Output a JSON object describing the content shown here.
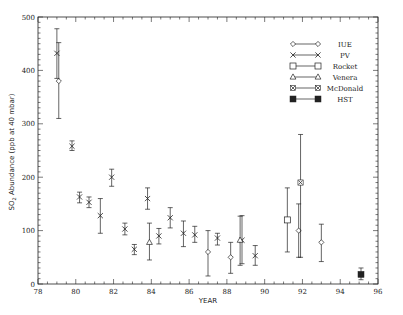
{
  "chart_data": {
    "type": "scatter",
    "title": "",
    "xlabel": "YEAR",
    "ylabel": "SO2 Abundance (ppb at 40 mbar)",
    "xlim": [
      78,
      96
    ],
    "ylim": [
      0,
      500
    ],
    "xticks": [
      78,
      80,
      82,
      84,
      86,
      88,
      90,
      92,
      94,
      96
    ],
    "yticks": [
      0,
      100,
      200,
      300,
      400,
      500
    ],
    "grid": false,
    "legend_position": "upper right",
    "series": [
      {
        "name": "IUE",
        "marker": "diamond-open",
        "points": [
          {
            "x": 79.1,
            "y": 380,
            "lo": 310,
            "hi": 452
          },
          {
            "x": 87.0,
            "y": 60,
            "lo": 15,
            "hi": 100
          },
          {
            "x": 88.2,
            "y": 50,
            "lo": 20,
            "hi": 78
          },
          {
            "x": 91.8,
            "y": 100,
            "lo": 50,
            "hi": 150
          },
          {
            "x": 93.0,
            "y": 78,
            "lo": 42,
            "hi": 112
          }
        ]
      },
      {
        "name": "PV",
        "marker": "x",
        "points": [
          {
            "x": 79.0,
            "y": 432,
            "lo": 385,
            "hi": 478
          },
          {
            "x": 79.8,
            "y": 258,
            "lo": 250,
            "hi": 268
          },
          {
            "x": 80.2,
            "y": 163,
            "lo": 152,
            "hi": 172
          },
          {
            "x": 80.7,
            "y": 153,
            "lo": 143,
            "hi": 163
          },
          {
            "x": 81.3,
            "y": 128,
            "lo": 95,
            "hi": 160
          },
          {
            "x": 81.9,
            "y": 200,
            "lo": 183,
            "hi": 215
          },
          {
            "x": 82.6,
            "y": 103,
            "lo": 92,
            "hi": 114
          },
          {
            "x": 83.1,
            "y": 65,
            "lo": 55,
            "hi": 74
          },
          {
            "x": 83.8,
            "y": 160,
            "lo": 140,
            "hi": 180
          },
          {
            "x": 84.4,
            "y": 90,
            "lo": 75,
            "hi": 104
          },
          {
            "x": 85.0,
            "y": 124,
            "lo": 105,
            "hi": 143
          },
          {
            "x": 85.7,
            "y": 95,
            "lo": 70,
            "hi": 118
          },
          {
            "x": 86.3,
            "y": 92,
            "lo": 78,
            "hi": 108
          },
          {
            "x": 87.5,
            "y": 86,
            "lo": 73,
            "hi": 95
          },
          {
            "x": 88.8,
            "y": 82,
            "lo": 38,
            "hi": 128
          },
          {
            "x": 89.5,
            "y": 53,
            "lo": 35,
            "hi": 72
          }
        ]
      },
      {
        "name": "Rocket",
        "marker": "square-open",
        "points": [
          {
            "x": 91.2,
            "y": 120,
            "lo": 60,
            "hi": 180
          }
        ]
      },
      {
        "name": "Venera",
        "marker": "triangle-open",
        "points": [
          {
            "x": 83.9,
            "y": 78,
            "lo": 45,
            "hi": 114
          },
          {
            "x": 88.7,
            "y": 82,
            "lo": 35,
            "hi": 127
          }
        ]
      },
      {
        "name": "McDonald",
        "marker": "x-boxed",
        "points": [
          {
            "x": 91.9,
            "y": 190,
            "lo": 50,
            "hi": 280
          }
        ]
      },
      {
        "name": "HST",
        "marker": "square-filled",
        "points": [
          {
            "x": 95.1,
            "y": 18,
            "lo": 8,
            "hi": 30
          }
        ]
      }
    ]
  },
  "labels": {
    "xlabel": "YEAR",
    "ylabel_pre": "SO",
    "ylabel_sub": "2",
    "ylabel_post": " Abundance (ppb at 40 mbar)"
  }
}
